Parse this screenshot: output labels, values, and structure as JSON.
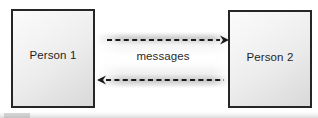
{
  "diagram": {
    "canvas": {
      "width": 318,
      "height": 118,
      "background": "#ffffff"
    },
    "nodes": [
      {
        "id": "person-1",
        "label": "Person 1",
        "shape": "rectangle",
        "border_color": "#262626",
        "fill": "#ececec"
      },
      {
        "id": "person-2",
        "label": "Person 2",
        "shape": "rectangle",
        "border_color": "#262626",
        "fill": "#ececec"
      }
    ],
    "channel": {
      "label": "messages",
      "label_color": "#2b2b2b",
      "arrows": [
        {
          "id": "arrow-forward",
          "from": "person-1",
          "to": "person-2",
          "direction": "right",
          "style": "dashed",
          "color": "#1a1a1a"
        },
        {
          "id": "arrow-reverse",
          "from": "person-2",
          "to": "person-1",
          "direction": "left",
          "style": "dashed",
          "color": "#1a1a1a"
        }
      ]
    }
  }
}
